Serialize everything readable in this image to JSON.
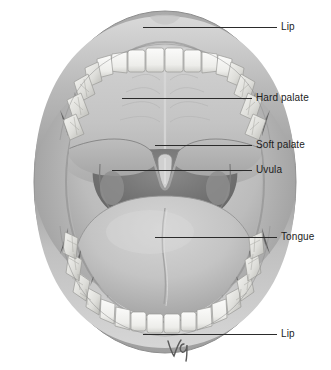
{
  "figure": {
    "background_color": "#ffffff",
    "line_color": "#2b2b2b",
    "text_color": "#1c1c1c",
    "artist_signature": "vq"
  },
  "labels": [
    {
      "id": "lip-upper",
      "text": "Lip",
      "text_x": 281,
      "text_y": 21,
      "line_x": 143,
      "line_w": 134,
      "line_y": 27
    },
    {
      "id": "hard-palate",
      "text": "Hard palate",
      "text_x": 256,
      "text_y": 92,
      "line_x": 122,
      "line_w": 130,
      "line_y": 98
    },
    {
      "id": "soft-palate",
      "text": "Soft palate",
      "text_x": 256,
      "text_y": 139,
      "line_x": 155,
      "line_w": 97,
      "line_y": 145
    },
    {
      "id": "uvula",
      "text": "Uvula",
      "text_x": 256,
      "text_y": 164,
      "line_x": 112,
      "line_w": 140,
      "line_y": 170
    },
    {
      "id": "tongue",
      "text": "Tongue",
      "text_x": 281,
      "text_y": 231,
      "line_x": 155,
      "line_w": 122,
      "line_y": 237
    },
    {
      "id": "lip-lower",
      "text": "Lip",
      "text_x": 281,
      "text_y": 328,
      "line_x": 143,
      "line_w": 134,
      "line_y": 334
    }
  ],
  "anatomy": {
    "parts": [
      "Lip",
      "Hard palate",
      "Soft palate",
      "Uvula",
      "Tongue",
      "Upper teeth",
      "Lower teeth",
      "Oropharynx"
    ],
    "palette": {
      "lip_outer": "#a9a9a9",
      "lip_inner": "#bdbdbd",
      "mucosa": "#c3c3c3",
      "hard_palate": "#c9c9c9",
      "soft_palate": "#b4b4b4",
      "tongue": "#c6c6c6",
      "throat_dark": "#6e6e6e",
      "tooth": "#f2f2f0",
      "tooth_shade": "#d6d6d2"
    }
  }
}
